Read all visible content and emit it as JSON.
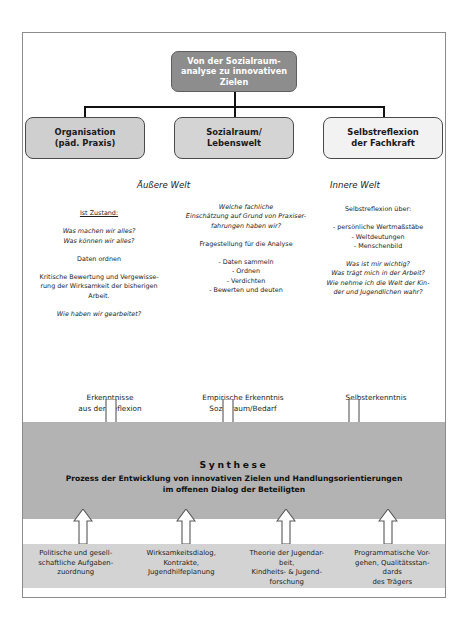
{
  "diagram": {
    "root": {
      "label": "Von der Sozialraum-\nanalyse zu innovativen\nZielen",
      "bg_color": "#8d8d8d",
      "text_color": "#ffffff"
    },
    "categories": [
      {
        "label": "Organisation\n(päd. Praxis)",
        "bg_color": "#cfcfcf"
      },
      {
        "label": "Sozialraum/\nLebenswelt",
        "bg_color": "#d4d4d4"
      },
      {
        "label": "Selbstreflexion\nder Fachkraft",
        "bg_color": "#f2f2f2"
      }
    ],
    "world_headings": {
      "outer": "Äußere Welt",
      "inner": "Innere Welt"
    },
    "columns": [
      {
        "name": "organisation",
        "blocks": [
          {
            "style": "underline",
            "lines": [
              "Ist Zustand:"
            ]
          },
          {
            "style": "italic",
            "lines": [
              "Was machen wir alles?",
              "Was können wir alles?"
            ]
          },
          {
            "style": "plain",
            "lines": [
              "Daten ordnen"
            ]
          },
          {
            "style": "plain",
            "lines": [
              "Kritische Bewertung und Vergewisse-",
              "rung der Wirksamkeit der bisherigen",
              "Arbeit."
            ]
          },
          {
            "style": "italic",
            "lines": [
              "Wie haben wir gearbeitet?"
            ]
          }
        ]
      },
      {
        "name": "sozialraum",
        "blocks": [
          {
            "style": "italic",
            "lines": [
              "Welche fachliche",
              "Einschätzung auf Grund von Praxiser-",
              "fahrungen haben wir?"
            ]
          },
          {
            "style": "plain",
            "lines": [
              "Fragestellung für die Analyse"
            ]
          },
          {
            "style": "plain",
            "lines": [
              "- Daten sammeln",
              "- Ordnen",
              "- Verdichten",
              "- Bewerten und deuten"
            ]
          }
        ]
      },
      {
        "name": "selbstreflexion",
        "blocks": [
          {
            "style": "plain",
            "lines": [
              "Selbstreflexion über:"
            ]
          },
          {
            "style": "plain",
            "lines": [
              "- persönliche Wertmaßstäbe",
              "- Weltdeutungen",
              "- Menschenbild"
            ]
          },
          {
            "style": "italic",
            "lines": [
              "Was ist mir wichtig?",
              "Was trägt mich in der Arbeit?",
              "Wie nehme ich die Welt der Kin-",
              "der und Jugendlichen wahr?"
            ]
          }
        ]
      }
    ],
    "results": [
      "Erkenntnisse\naus der Reflexion",
      "Empirische Erkenntnis\nSozialraum/Bedarf",
      "Selbsterkenntnis"
    ],
    "synthesis": {
      "title": "Synthese",
      "subtitle": "Prozess der Entwicklung von innovativen Zielen und Handlungsorientierungen\nim offenen Dialog der Beteiligten",
      "band_color": "#b3b3b3"
    },
    "foundations": [
      "Politische und gesell-\nschaftliche Aufgaben-\nzuordnung",
      "Wirksamkeitsdialog,\nKontrakte,\nJugendhilfeplanung",
      "Theorie der Jugendar-\nbeit,\nKindheits- & Jugend-\nforschung",
      "Programmatische Vor-\ngehen, Qualitätsstan-\ndards\ndes Trägers"
    ],
    "arrows": {
      "down_count": 3,
      "down_icon": "arrow-down-icon",
      "up_count": 4,
      "up_icon": "arrow-up-icon"
    }
  }
}
